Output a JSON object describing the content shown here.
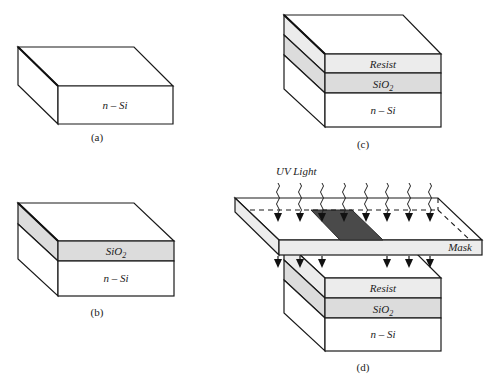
{
  "figure": {
    "panels": [
      {
        "id": "a",
        "caption": "(a)",
        "layers": [
          "n – Si"
        ]
      },
      {
        "id": "b",
        "caption": "(b)",
        "layers": [
          "SiO2",
          "n – Si"
        ]
      },
      {
        "id": "c",
        "caption": "(c)",
        "layers": [
          "Resist",
          "SiO2",
          "n – Si"
        ]
      },
      {
        "id": "d",
        "caption": "(d)",
        "layers": [
          "Resist",
          "SiO2",
          "n – Si"
        ],
        "light_label": "UV Light",
        "mask_label": "Mask"
      }
    ],
    "labels": {
      "nsi": "n – Si",
      "sio2_base": "SiO",
      "sio2_sub": "2",
      "resist": "Resist",
      "uv_light": "UV Light",
      "mask": "Mask",
      "cap_a": "(a)",
      "cap_b": "(b)",
      "cap_c": "(c)",
      "cap_d": "(d)"
    },
    "colors": {
      "resist": "#ececec",
      "sio2": "#dcdcdc",
      "silicon": "#ffffff",
      "mask_opaque": "#4a4a4a"
    }
  }
}
